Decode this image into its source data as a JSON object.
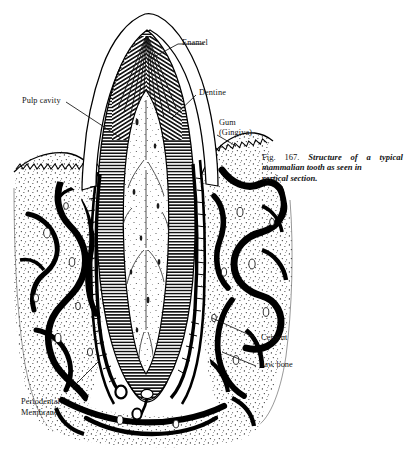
{
  "figure": {
    "caption_number": "Fig. 167.",
    "caption_text": "Structure of a typical mammalian tooth as seen in vertical section.",
    "caption_line1": "Structure of a",
    "caption_line2": "typical mammalian",
    "caption_line3": "tooth as seen in",
    "caption_line4": "vertical section.",
    "title": "Structure of a typical mammalian tooth as seen in vertical section",
    "background_color": "#ffffff",
    "ink_color": "#000000"
  },
  "labels": {
    "enamel": "Enamel",
    "dentine": "Dentine",
    "gum_line1": "Gum",
    "gum_line2": "(Gingiva)",
    "pulp_cavity": "Pulp cavity",
    "cement": "Cement",
    "jaw_bone": "Jaw bone",
    "periodental_line1": "Periodental",
    "periodental_line2": "Membrane"
  },
  "anatomy": {
    "parts": [
      {
        "name": "enamel",
        "label": "Enamel",
        "region": "crown-outer-layer",
        "texture": "outline-clear"
      },
      {
        "name": "dentine",
        "label": "Dentine",
        "region": "tooth-body",
        "texture": "dense-hatching"
      },
      {
        "name": "pulp-cavity",
        "label": "Pulp cavity",
        "region": "tooth-core",
        "texture": "stippled-light"
      },
      {
        "name": "gum",
        "label": "Gum (Gingiva)",
        "region": "soft-tissue",
        "texture": "zigzag-epithelium"
      },
      {
        "name": "cement",
        "label": "Cement",
        "region": "root-outer-layer",
        "texture": "thin-dark-band"
      },
      {
        "name": "jaw-bone",
        "label": "Jaw bone",
        "region": "alveolar-bone",
        "texture": "trabecular-stipple"
      },
      {
        "name": "periodental-membrane",
        "label": "Periodental Membrane",
        "region": "root-socket-interface",
        "texture": "fine-fibres"
      }
    ]
  }
}
